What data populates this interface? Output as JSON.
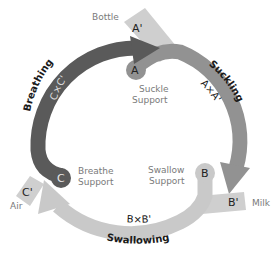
{
  "diagram": {
    "type": "cycle",
    "colors": {
      "breathing": "#5a5a5a",
      "suckling": "#929292",
      "swallowing": "#c9c9c9",
      "supply_box": "#cfcfcf",
      "support_text": "#7a7a7a",
      "phase_text": "#1a1a1a"
    },
    "phases": [
      {
        "id": "breathing",
        "name": "Breathing",
        "product": "C×C'"
      },
      {
        "id": "suckling",
        "name": "Suckling",
        "product": "A×A'"
      },
      {
        "id": "swallowing",
        "name": "Swallowing",
        "product": "B×B'"
      }
    ],
    "supports": [
      {
        "id": "A",
        "node": "A",
        "label_line1": "Suckle",
        "label_line2": "Support"
      },
      {
        "id": "B",
        "node": "B",
        "label_line1": "Swallow",
        "label_line2": "Support"
      },
      {
        "id": "C",
        "node": "C",
        "label_line1": "Breathe",
        "label_line2": "Support"
      }
    ],
    "inputs": [
      {
        "id": "A'",
        "node": "A'",
        "label": "Bottle"
      },
      {
        "id": "B'",
        "node": "B'",
        "label": "Milk"
      },
      {
        "id": "C'",
        "node": "C'",
        "label": "Air"
      }
    ]
  }
}
